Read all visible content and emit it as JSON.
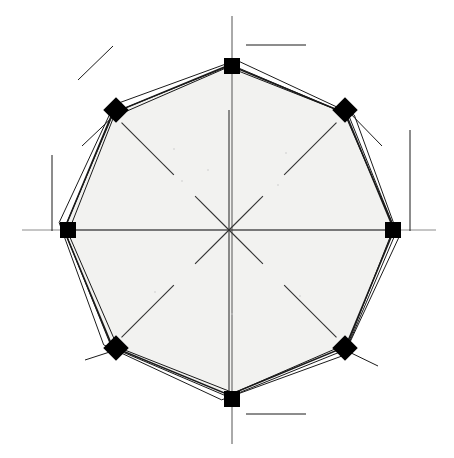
{
  "canvas": {
    "width": 454,
    "height": 458,
    "background": "#ffffff"
  },
  "figure": {
    "type": "octagonal-polar-diagram",
    "center": {
      "x": 229,
      "y": 230
    },
    "fill_color": "#f2f2f0",
    "stroke_color": "#1a1a1a",
    "axis_color": "#8c8c8c",
    "spoke_color": "#333333",
    "marker_color": "#000000",
    "vertex_count": 8
  },
  "chart_data": {
    "type": "scatter",
    "title": "",
    "subtitle": "",
    "xlabel": "",
    "ylabel": "",
    "grid": false,
    "legend_position": "none",
    "center": {
      "x": 229,
      "y": 230
    },
    "angles_deg": [
      270,
      315,
      0,
      45,
      90,
      135,
      180,
      225
    ],
    "series": [
      {
        "name": "outline-1",
        "marker": "none",
        "radius": 170,
        "rotation_deg": 2.5,
        "offset": {
          "x": 0,
          "y": 0
        },
        "stroke_width": 1.0
      },
      {
        "name": "outline-2",
        "marker": "none",
        "radius": 166,
        "rotation_deg": 0.5,
        "offset": {
          "x": 1,
          "y": 1
        },
        "stroke_width": 1.0
      },
      {
        "name": "outline-3",
        "marker": "none",
        "radius": 163,
        "rotation_deg": -1.0,
        "offset": {
          "x": 2,
          "y": 0
        },
        "stroke_width": 1.0
      },
      {
        "name": "outline-main",
        "marker": "square-and-diamond",
        "radius": 165,
        "rotation_deg": 0,
        "offset": {
          "x": 0,
          "y": 0
        },
        "stroke_width": 1.6
      }
    ],
    "vertices": [
      {
        "index": 0,
        "label": "N",
        "angle_deg": 270,
        "x": 232,
        "y": 66,
        "marker": "square",
        "size": 16
      },
      {
        "index": 1,
        "label": "NE",
        "angle_deg": 315,
        "x": 345,
        "y": 110,
        "marker": "diamond",
        "size": 18
      },
      {
        "index": 2,
        "label": "E",
        "angle_deg": 0,
        "x": 393,
        "y": 230,
        "marker": "square",
        "size": 16
      },
      {
        "index": 3,
        "label": "SE",
        "angle_deg": 45,
        "x": 345,
        "y": 348,
        "marker": "diamond",
        "size": 18
      },
      {
        "index": 4,
        "label": "S",
        "angle_deg": 90,
        "x": 232,
        "y": 399,
        "marker": "square",
        "size": 16
      },
      {
        "index": 5,
        "label": "SW",
        "angle_deg": 135,
        "x": 116,
        "y": 348,
        "marker": "diamond",
        "size": 18
      },
      {
        "index": 6,
        "label": "W",
        "angle_deg": 180,
        "x": 68,
        "y": 230,
        "marker": "square",
        "size": 16
      },
      {
        "index": 7,
        "label": "NW",
        "angle_deg": 225,
        "x": 116,
        "y": 110,
        "marker": "diamond",
        "size": 18
      }
    ],
    "spokes": [
      {
        "name": "spoke-n",
        "angle_deg": 270,
        "inner": 0,
        "outer": 120,
        "style": "solid"
      },
      {
        "name": "spoke-ne",
        "angle_deg": 315,
        "inner": 0,
        "outer": 48,
        "style": "solid"
      },
      {
        "name": "spoke-ne-outer",
        "angle_deg": 315,
        "inner": 78,
        "outer": 152,
        "style": "solid"
      },
      {
        "name": "spoke-e",
        "angle_deg": 0,
        "inner": 0,
        "outer": 162,
        "style": "solid"
      },
      {
        "name": "spoke-se",
        "angle_deg": 45,
        "inner": 0,
        "outer": 48,
        "style": "solid"
      },
      {
        "name": "spoke-se-outer",
        "angle_deg": 45,
        "inner": 78,
        "outer": 152,
        "style": "solid"
      },
      {
        "name": "spoke-s",
        "angle_deg": 90,
        "inner": 0,
        "outer": 168,
        "style": "solid"
      },
      {
        "name": "spoke-sw",
        "angle_deg": 135,
        "inner": 0,
        "outer": 48,
        "style": "solid"
      },
      {
        "name": "spoke-sw-outer",
        "angle_deg": 135,
        "inner": 78,
        "outer": 152,
        "style": "solid"
      },
      {
        "name": "spoke-w",
        "angle_deg": 180,
        "inner": 0,
        "outer": 162,
        "style": "solid"
      },
      {
        "name": "spoke-nw",
        "angle_deg": 225,
        "inner": 0,
        "outer": 48,
        "style": "solid"
      },
      {
        "name": "spoke-nw-outer",
        "angle_deg": 225,
        "inner": 78,
        "outer": 152,
        "style": "solid"
      }
    ],
    "axis_lines": [
      {
        "name": "axis-horizontal",
        "x1": 22,
        "y1": 230,
        "x2": 436,
        "y2": 230,
        "color": "#8c8c8c"
      },
      {
        "name": "axis-vertical",
        "x1": 232,
        "y1": 16,
        "x2": 232,
        "y2": 444,
        "color": "#555555"
      }
    ],
    "tangent_marks": [
      {
        "name": "tangent-top-right",
        "x1": 246,
        "y1": 45,
        "x2": 306,
        "y2": 45
      },
      {
        "name": "tangent-top-left",
        "x1": 78,
        "y1": 80,
        "x2": 113,
        "y2": 46
      },
      {
        "name": "tangent-left-upper",
        "x1": 52,
        "y1": 155,
        "x2": 52,
        "y2": 231
      },
      {
        "name": "tangent-right-upper",
        "x1": 410,
        "y1": 130,
        "x2": 410,
        "y2": 231
      },
      {
        "name": "tangent-bottom-right",
        "x1": 246,
        "y1": 414,
        "x2": 306,
        "y2": 414
      },
      {
        "name": "tangent-nw-outer",
        "x1": 82,
        "y1": 146,
        "x2": 120,
        "y2": 110
      },
      {
        "name": "tangent-ne-outer",
        "x1": 345,
        "y1": 108,
        "x2": 382,
        "y2": 146
      },
      {
        "name": "tangent-sw-outer",
        "x1": 85,
        "y1": 360,
        "x2": 122,
        "y2": 348
      },
      {
        "name": "tangent-se-outer",
        "x1": 345,
        "y1": 350,
        "x2": 378,
        "y2": 366
      }
    ],
    "dust_specks": [
      {
        "x": 174,
        "y": 149
      },
      {
        "x": 286,
        "y": 153
      },
      {
        "x": 182,
        "y": 181
      },
      {
        "x": 278,
        "y": 185
      },
      {
        "x": 155,
        "y": 292
      },
      {
        "x": 300,
        "y": 296
      },
      {
        "x": 232,
        "y": 314
      },
      {
        "x": 208,
        "y": 170
      }
    ]
  }
}
